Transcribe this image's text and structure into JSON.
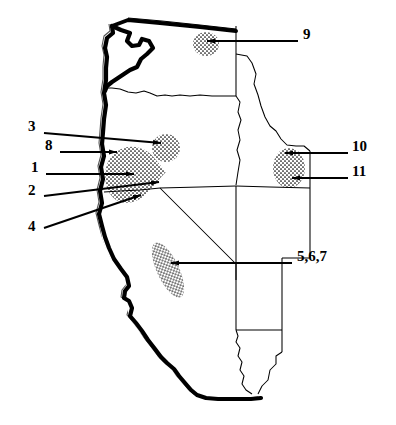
{
  "figure": {
    "type": "line-art-map",
    "region": "Western United States",
    "background_color": "#ffffff",
    "ink_color": "#000000",
    "coastline_style": "heavy black outline with thin offset shadow line",
    "fill_style": "white polygons with thin black state borders",
    "marked_area_style": "stippled / dotted shading"
  },
  "labels": [
    {
      "id": "label-9",
      "text": "9",
      "x": 303,
      "y": 34,
      "anchor": "left",
      "leader": {
        "from": [
          298,
          41
        ],
        "to": [
          203,
          41
        ],
        "arrow": true
      },
      "target_area": "northeastern-washington"
    },
    {
      "id": "label-3",
      "text": "3",
      "x": 28,
      "y": 126,
      "anchor": "left",
      "leader": {
        "from": [
          44,
          133
        ],
        "to": [
          163,
          142
        ],
        "arrow": true
      },
      "target_area": "upper-stipple-patch-south-central-oregon"
    },
    {
      "id": "label-10",
      "text": "10",
      "x": 352,
      "y": 146,
      "anchor": "left",
      "leader": {
        "from": [
          348,
          153
        ],
        "to": [
          283,
          153
        ],
        "arrow": true
      },
      "target_area": "northwestern-wyoming-yellowstone"
    },
    {
      "id": "label-8",
      "text": "8",
      "x": 45,
      "y": 145,
      "anchor": "left",
      "leader": {
        "from": [
          60,
          152
        ],
        "to": [
          115,
          152
        ],
        "arrow": true
      },
      "target_area": "west-edge-klamath-stipple"
    },
    {
      "id": "label-1",
      "text": "1",
      "x": 31,
      "y": 167,
      "anchor": "left",
      "leader": {
        "from": [
          46,
          174
        ],
        "to": [
          131,
          174
        ],
        "arrow": true
      },
      "target_area": "klamath-stipple-interior"
    },
    {
      "id": "label-11",
      "text": "11",
      "x": 352,
      "y": 171,
      "anchor": "left",
      "leader": {
        "from": [
          348,
          178
        ],
        "to": [
          290,
          178
        ],
        "arrow": true
      },
      "target_area": "northwestern-wyoming-yellowstone"
    },
    {
      "id": "label-2",
      "text": "2",
      "x": 28,
      "y": 190,
      "anchor": "left",
      "leader": {
        "from": [
          44,
          196
        ],
        "to": [
          157,
          182
        ],
        "arrow": true
      },
      "target_area": "klamath-stipple-east-tip"
    },
    {
      "id": "label-4",
      "text": "4",
      "x": 28,
      "y": 225,
      "anchor": "left",
      "leader": {
        "from": [
          44,
          228
        ],
        "to": [
          139,
          196
        ],
        "arrow": true
      },
      "target_area": "klamath-stipple-southeast"
    },
    {
      "id": "label-567",
      "text": "5,6,7",
      "x": 297,
      "y": 256,
      "anchor": "left",
      "leader": {
        "from": [
          292,
          263
        ],
        "to": [
          170,
          263
        ],
        "arrow": true
      },
      "target_area": "western-nevada-stipple-belt"
    }
  ],
  "stipple_areas": [
    {
      "id": "stipple-ne-washington",
      "label_ids": [
        "9"
      ],
      "cx": 206,
      "cy": 44,
      "rx": 13,
      "ry": 13,
      "rot": 0
    },
    {
      "id": "stipple-upper-oregon",
      "label_ids": [
        "3"
      ],
      "cx": 166,
      "cy": 148,
      "rx": 14,
      "ry": 14,
      "rot": 0
    },
    {
      "id": "stipple-klamath-main",
      "label_ids": [
        "8",
        "1",
        "2",
        "4"
      ],
      "cx": 134,
      "cy": 175,
      "rx": 30,
      "ry": 30,
      "rot": 0
    },
    {
      "id": "stipple-wyoming",
      "label_ids": [
        "10",
        "11"
      ],
      "cx": 289,
      "cy": 168,
      "rx": 17,
      "ry": 20,
      "rot": 0
    },
    {
      "id": "stipple-west-nevada",
      "label_ids": [
        "5",
        "6",
        "7"
      ],
      "cx": 168,
      "cy": 270,
      "rx": 11,
      "ry": 30,
      "rot": -25
    }
  ],
  "states_depicted": [
    "Washington",
    "Oregon",
    "Idaho",
    "California",
    "Nevada",
    "Utah",
    "Wyoming",
    "Arizona"
  ]
}
